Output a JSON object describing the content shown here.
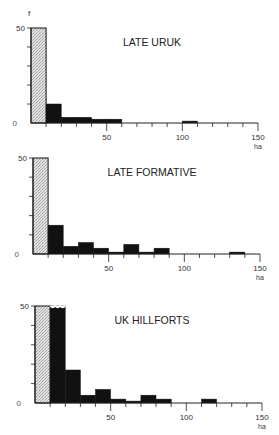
{
  "figure": {
    "y_axis_symbol": "f",
    "x_unit": "ha",
    "stipple_color": "#d4d4d4",
    "bar_color": "#111111",
    "axis_color": "#222222"
  },
  "chart_data": [
    {
      "type": "bar",
      "title": "LATE URUK",
      "xlabel": "ha",
      "ylabel": "f",
      "bin_width": 10,
      "xlim": [
        0,
        150
      ],
      "ylim": [
        0,
        50
      ],
      "x_ticks": [
        0,
        10,
        20,
        30,
        40,
        50,
        60,
        70,
        80,
        90,
        100,
        110,
        120,
        130,
        140,
        150
      ],
      "x_tick_labels": [
        "50",
        "100",
        "150"
      ],
      "y_tick_labels": [
        "0",
        "50"
      ],
      "grid": false,
      "categories": [
        "0-10",
        "10-20",
        "20-30",
        "30-40",
        "40-50",
        "50-60",
        "60-70",
        "70-80",
        "80-90",
        "90-100",
        "100-110",
        "110-120",
        "120-130",
        "130-140",
        "140-150"
      ],
      "values": [
        50,
        10,
        3,
        3,
        2,
        2,
        0,
        0,
        0,
        0,
        1,
        0,
        0,
        0,
        0
      ],
      "off_scale_bins": [
        "0-10"
      ],
      "stippled_bins": [
        "0-10"
      ],
      "label_top": 14,
      "y50": 28,
      "y0": 123,
      "x0": 31,
      "x150": 258
    },
    {
      "type": "bar",
      "title": "LATE FORMATIVE",
      "xlabel": "ha",
      "ylabel": "f",
      "bin_width": 10,
      "xlim": [
        0,
        150
      ],
      "ylim": [
        0,
        50
      ],
      "x_ticks": [
        0,
        10,
        20,
        30,
        40,
        50,
        60,
        70,
        80,
        90,
        100,
        110,
        120,
        130,
        140,
        150
      ],
      "x_tick_labels": [
        "50",
        "100",
        "150"
      ],
      "y_tick_labels": [
        "0",
        "50"
      ],
      "grid": false,
      "categories": [
        "0-10",
        "10-20",
        "20-30",
        "30-40",
        "40-50",
        "50-60",
        "60-70",
        "70-80",
        "80-90",
        "90-100",
        "100-110",
        "110-120",
        "120-130",
        "130-140",
        "140-150"
      ],
      "values": [
        50,
        15,
        4,
        6,
        3,
        1,
        5,
        1,
        3,
        0,
        0,
        0,
        0,
        1,
        0
      ],
      "off_scale_bins": [
        "0-10"
      ],
      "stippled_bins": [
        "0-10"
      ],
      "y50": 158,
      "y0": 254,
      "x0": 33,
      "x150": 260
    },
    {
      "type": "bar",
      "title": "UK HILLFORTS",
      "xlabel": "ha",
      "ylabel": "f",
      "bin_width": 10,
      "xlim": [
        0,
        150
      ],
      "ylim": [
        0,
        50
      ],
      "x_ticks": [
        0,
        10,
        20,
        30,
        40,
        50,
        60,
        70,
        80,
        90,
        100,
        110,
        120,
        130,
        140,
        150
      ],
      "x_tick_labels": [
        "50",
        "100",
        "150"
      ],
      "y_tick_labels": [
        "0",
        "50"
      ],
      "grid": false,
      "categories": [
        "0-10",
        "10-20",
        "20-30",
        "30-40",
        "40-50",
        "50-60",
        "60-70",
        "70-80",
        "80-90",
        "90-100",
        "100-110",
        "110-120",
        "120-130",
        "130-140",
        "140-150"
      ],
      "values": [
        50,
        50,
        17,
        4,
        7,
        2,
        1,
        4,
        2,
        0,
        0,
        2,
        0,
        0,
        0
      ],
      "off_scale_bins": [
        "0-10",
        "10-20"
      ],
      "stippled_bins": [
        "0-10"
      ],
      "y50": 306,
      "y0": 403,
      "x0": 35,
      "x150": 262
    }
  ]
}
